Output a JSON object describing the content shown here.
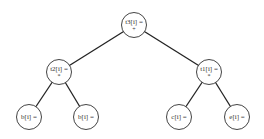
{
  "diagram": {
    "type": "expression-tree",
    "nodes": [
      {
        "id": "root",
        "label": "t3[i] =",
        "op": "+",
        "cx": 134,
        "cy": 25
      },
      {
        "id": "t2",
        "label": "t2[i] =",
        "op": "*",
        "cx": 59,
        "cy": 72
      },
      {
        "id": "t1",
        "label": "t1[i] =",
        "op": "*",
        "cx": 209,
        "cy": 72
      },
      {
        "id": "b1",
        "label": "b[i] =",
        "op": "",
        "cx": 29,
        "cy": 117
      },
      {
        "id": "b2",
        "label": "b[i] =",
        "op": "",
        "cx": 86,
        "cy": 117
      },
      {
        "id": "c",
        "label": "c[i] =",
        "op": "",
        "cx": 179,
        "cy": 117
      },
      {
        "id": "e",
        "label": "e[i] =",
        "op": "",
        "cx": 237,
        "cy": 117
      }
    ],
    "edges": [
      [
        "root",
        "t2"
      ],
      [
        "root",
        "t1"
      ],
      [
        "t2",
        "b1"
      ],
      [
        "t2",
        "b2"
      ],
      [
        "t1",
        "c"
      ],
      [
        "t1",
        "e"
      ]
    ]
  }
}
